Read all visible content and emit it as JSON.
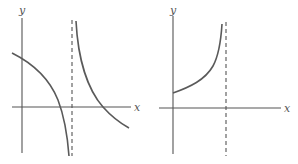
{
  "graphs": [
    {
      "id": "left",
      "axis_labels": {
        "x": "x",
        "y": "y"
      },
      "description": "Function with vertical asymptote; decreasing branch left of asymptote crossing y-axis and x-axis going to -infinity, decreasing branch right of asymptote coming from +infinity crossing x-axis",
      "has_vertical_asymptote": true
    },
    {
      "id": "right",
      "axis_labels": {
        "x": "x",
        "y": "y"
      },
      "description": "Increasing curve starting at positive y-intercept and rising toward +infinity at a vertical asymptote",
      "has_vertical_asymptote": true
    }
  ],
  "colors": {
    "stroke": "#555555",
    "background": "#ffffff"
  }
}
